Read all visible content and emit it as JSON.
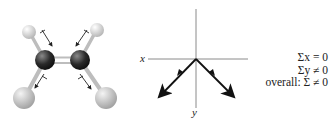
{
  "molecule": {
    "name": "cis-dichloroethene ball-and-stick model",
    "atoms": [
      {
        "id": "H1",
        "element": "H"
      },
      {
        "id": "H2",
        "element": "H"
      },
      {
        "id": "C1",
        "element": "C"
      },
      {
        "id": "C2",
        "element": "C"
      },
      {
        "id": "Cl1",
        "element": "Cl"
      },
      {
        "id": "Cl2",
        "element": "Cl"
      }
    ],
    "colors": {
      "H": "#e9e9e9",
      "C": "#2b2b2b",
      "Cl": "#c9c9c9",
      "bond": "#bdbdbd"
    }
  },
  "axes": {
    "x_label": "x",
    "y_label": "y"
  },
  "equations": {
    "line1": "Σx = 0",
    "line2": "Σy ≠ 0",
    "line3": "overall: Σ ≠ 0"
  }
}
